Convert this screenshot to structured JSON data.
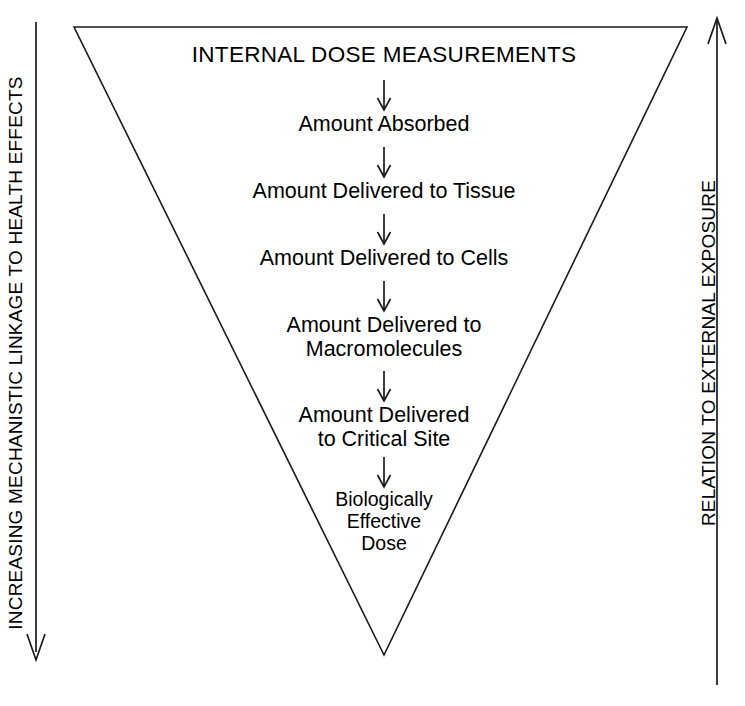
{
  "figure": {
    "title": "INTERNAL DOSE MEASUREMENTS",
    "background_color": "#ffffff",
    "line_color": "#1a1a1a",
    "text_color": "#000000"
  },
  "flow": {
    "heading": "INTERNAL DOSE MEASUREMENTS",
    "steps": [
      {
        "label": "Amount Absorbed"
      },
      {
        "label": "Amount Delivered to Tissue"
      },
      {
        "label": "Amount Delivered to Cells"
      },
      {
        "label": "Amount Delivered to\nMacromolecules"
      },
      {
        "label": "Amount Delivered\nto Critical Site"
      },
      {
        "label": "Biologically\nEffective\nDose"
      }
    ],
    "arrow_icon": "arrow-down-icon",
    "arrow_count": 6
  },
  "axes": {
    "left": {
      "label": "INCREASING MECHANISTIC LINKAGE TO HEALTH EFFECTS",
      "direction": "down",
      "arrow_icon": "arrow-down-icon"
    },
    "right": {
      "label": "RELATION TO EXTERNAL EXPOSURE",
      "direction": "up",
      "arrow_icon": "arrow-up-icon"
    }
  },
  "shape": {
    "name": "inverted-triangle",
    "points": "74,27 687,27 384,655"
  }
}
